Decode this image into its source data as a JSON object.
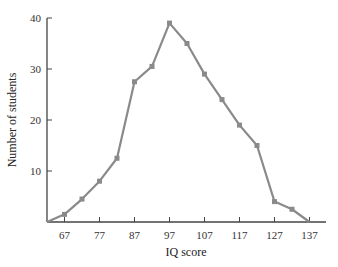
{
  "chart_data": {
    "type": "line",
    "title": "",
    "xlabel": "IQ score",
    "ylabel": "Number of students",
    "x": [
      62,
      67,
      72,
      77,
      82,
      87,
      92,
      97,
      102,
      107,
      112,
      117,
      122,
      127,
      132,
      137
    ],
    "values": [
      0,
      1.5,
      4.5,
      8,
      12.5,
      27.5,
      30.5,
      39,
      35,
      29,
      24,
      19,
      15,
      4,
      2.5,
      0
    ],
    "x_tick_labels": [
      "67",
      "77",
      "87",
      "97",
      "107",
      "117",
      "127",
      "137"
    ],
    "x_ticks": [
      67,
      77,
      87,
      97,
      107,
      117,
      127,
      137
    ],
    "y_tick_labels": [
      "10",
      "20",
      "30",
      "40"
    ],
    "y_ticks": [
      10,
      20,
      30,
      40
    ],
    "xlim": [
      62,
      142
    ],
    "ylim": [
      0,
      40
    ],
    "grid": false,
    "legend": null,
    "markers": "square",
    "line_color": "#8a8a8a",
    "axis_color": "#444444"
  }
}
